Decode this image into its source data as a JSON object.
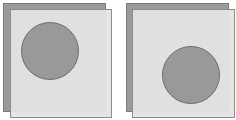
{
  "colors": {
    "background": "#ffffff",
    "back_rect_fill": "#9a9a9a",
    "back_rect_stroke": "#7a7a7a",
    "front_rect_fill": "#e4e4e4",
    "front_rect_stroke": "#8c8c8c",
    "circle_fill": "#999999",
    "circle_stroke": "#6e6e6e"
  },
  "panels": [
    {
      "name": "panel-left",
      "back_rect": {
        "x": 3,
        "y": 3,
        "w": 102,
        "h": 108
      },
      "front_rect": {
        "x": 10,
        "y": 9,
        "w": 101,
        "h": 108
      },
      "circle": {
        "cx": 50,
        "cy": 51,
        "r": 28.5
      }
    },
    {
      "name": "panel-right",
      "back_rect": {
        "x": 126,
        "y": 3,
        "w": 102,
        "h": 108
      },
      "front_rect": {
        "x": 132,
        "y": 9,
        "w": 102,
        "h": 108
      },
      "circle": {
        "cx": 191,
        "cy": 75,
        "r": 28.5
      }
    }
  ]
}
